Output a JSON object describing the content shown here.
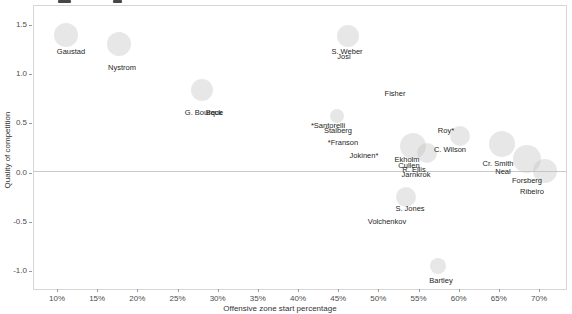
{
  "figure": {
    "note": "cropped chart title, only letter descenders visible at top edge"
  },
  "chart_data": {
    "type": "scatter",
    "title": "",
    "xlabel": "Offensive zone start percentage",
    "ylabel": "Quality of competition",
    "x_tick_labels": [
      "10%",
      "15%",
      "20%",
      "25%",
      "30%",
      "35%",
      "40%",
      "45%",
      "50%",
      "55%",
      "60%",
      "65%",
      "70%"
    ],
    "y_tick_labels": [
      "1.5",
      "1.0",
      "0.5",
      "0.0",
      "-0.5",
      "-1.0"
    ],
    "xlim": [
      7.5,
      73.5
    ],
    "ylim": [
      -1.2,
      1.7
    ],
    "grid": false,
    "legend": false,
    "reference_line_y": 0.0,
    "colors": {
      "bubble_fill": "#c4c4c4",
      "point_label": "#262626",
      "axis_text": "#4d4d4d",
      "reference_line": "#c9c9c9",
      "panel_border": "#d6d6d6"
    },
    "points": [
      {
        "label": "Gaustad",
        "x": 11.1,
        "y": 1.39,
        "lx": 71,
        "ly": 52
      },
      {
        "label": "Nystrom",
        "x": 17.7,
        "y": 1.3,
        "lx": 122,
        "ly": 68
      },
      {
        "label": "G. Bourque",
        "x": 28.0,
        "y": 0.83,
        "lx": 204,
        "ly": 113
      },
      {
        "label": "Beck",
        "x": 28.4,
        "y": 0.83,
        "lx": 214,
        "ly": 113
      },
      {
        "label": "S. Weber",
        "x": 46.2,
        "y": 1.38,
        "lx": 347,
        "ly": 52
      },
      {
        "label": "Josi",
        "x": 45.7,
        "y": 1.33,
        "lx": 344,
        "ly": 57
      },
      {
        "label": "Fisher",
        "x": 52.0,
        "y": 0.79,
        "lx": 395,
        "ly": 94
      },
      {
        "label": "*Santorelli",
        "x": 43.7,
        "y": 0.57,
        "lx": 328,
        "ly": 126
      },
      {
        "label": "Stalberg",
        "x": 44.9,
        "y": 0.52,
        "lx": 338,
        "ly": 131
      },
      {
        "label": "*Franson",
        "x": 45.6,
        "y": 0.29,
        "lx": 343,
        "ly": 143
      },
      {
        "label": "Jokinen*",
        "x": 48.2,
        "y": 0.16,
        "lx": 364,
        "ly": 156
      },
      {
        "label": "Ekholm",
        "x": 54.3,
        "y": 0.26,
        "lx": 407,
        "ly": 160
      },
      {
        "label": "Cullen",
        "x": 54.6,
        "y": 0.19,
        "lx": 409,
        "ly": 166
      },
      {
        "label": "R. Ellis",
        "x": 55.2,
        "y": 0.13,
        "lx": 414,
        "ly": 170
      },
      {
        "label": "Jarnkrok",
        "x": 55.4,
        "y": 0.08,
        "lx": 416,
        "ly": 175
      },
      {
        "label": "Roy*",
        "x": 60.1,
        "y": 0.37,
        "lx": 446,
        "ly": 131
      },
      {
        "label": "C. Wilson",
        "x": 58.9,
        "y": 0.22,
        "lx": 450,
        "ly": 150
      },
      {
        "label": "Cr. Smith",
        "x": 65.4,
        "y": 0.28,
        "lx": 498,
        "ly": 164
      },
      {
        "label": "Neal",
        "x": 68.5,
        "y": 0.13,
        "lx": 503,
        "ly": 172
      },
      {
        "label": "Forsberg",
        "x": 68.4,
        "y": 0.03,
        "lx": 527,
        "ly": 181
      },
      {
        "label": "Ribeiro",
        "x": 70.9,
        "y": -0.05,
        "lx": 532,
        "ly": 192
      },
      {
        "label": "S. Jones",
        "x": 53.4,
        "y": -0.26,
        "lx": 410,
        "ly": 209
      },
      {
        "label": "Volchenkov",
        "x": 51.0,
        "y": -0.51,
        "lx": 387,
        "ly": 222
      },
      {
        "label": "Bartley",
        "x": 57.4,
        "y": -0.96,
        "lx": 441,
        "ly": 281
      }
    ],
    "bubbles_px": [
      [
        66,
        35,
        12
      ],
      [
        119,
        44,
        12
      ],
      [
        202,
        90,
        11
      ],
      [
        348,
        36,
        11
      ],
      [
        337,
        116,
        7
      ],
      [
        413,
        146,
        13
      ],
      [
        427,
        153,
        10
      ],
      [
        460,
        136,
        10
      ],
      [
        502,
        144,
        13
      ],
      [
        527,
        159,
        14
      ],
      [
        545,
        171,
        12
      ],
      [
        406,
        197,
        10
      ],
      [
        438,
        266,
        8
      ]
    ]
  }
}
